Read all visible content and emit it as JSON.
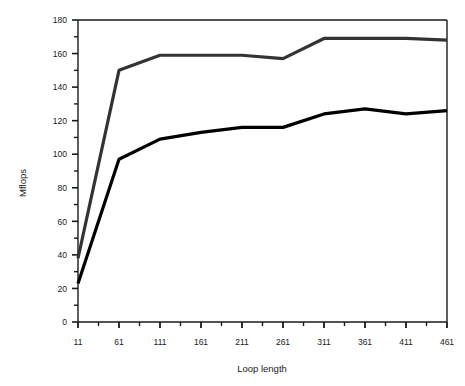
{
  "chart_data": {
    "type": "line",
    "title": "",
    "subtitle": "",
    "xlabel": "Loop length",
    "ylabel": "Mflops",
    "x": [
      11,
      61,
      111,
      161,
      211,
      261,
      311,
      361,
      411,
      461
    ],
    "xlim": [
      11,
      461
    ],
    "ylim": [
      0,
      180
    ],
    "x_tick_labels": [
      "11",
      "61",
      "111",
      "161",
      "211",
      "261",
      "311",
      "361",
      "411",
      "461"
    ],
    "y_tick_labels": [
      "0",
      "20",
      "40",
      "60",
      "80",
      "100",
      "120",
      "140",
      "160",
      "180"
    ],
    "y_major_step": 20,
    "y_minor_step": 10,
    "x_minor_step": 25,
    "grid": false,
    "legend": "none",
    "series": [
      {
        "name": "upper",
        "color": "#333333",
        "values": [
          38,
          150,
          159,
          159,
          159,
          157,
          169,
          169,
          169,
          168
        ]
      },
      {
        "name": "lower",
        "color": "#000000",
        "values": [
          23,
          97,
          109,
          113,
          116,
          116,
          124,
          127,
          124,
          126
        ]
      }
    ],
    "annotations": []
  },
  "axes": {
    "x_title": "Loop length",
    "y_title": "Mflops",
    "x_ticks": [
      "11",
      "61",
      "111",
      "161",
      "211",
      "261",
      "311",
      "361",
      "411",
      "461"
    ],
    "y_ticks": [
      "180",
      "160",
      "140",
      "120",
      "100",
      "80",
      "60",
      "40",
      "20",
      "0"
    ]
  },
  "colors": {
    "background": "#ffffff",
    "axis": "#1a1a1a",
    "upper_series": "#333333",
    "lower_series": "#000000",
    "text": "#1a1a1a"
  }
}
